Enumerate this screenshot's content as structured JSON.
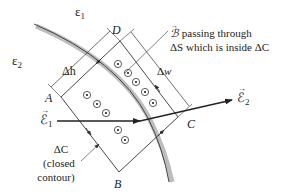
{
  "diagram": {
    "colors": {
      "line": "#333333",
      "boundary": "#b8b8b8",
      "boundary_edge": "#555555",
      "text": "#222222"
    },
    "regions": {
      "medium1_label": "ε",
      "medium1_sub": "1",
      "medium2_label": "ε",
      "medium2_sub": "2"
    },
    "corners": {
      "A": "A",
      "B": "B",
      "C": "C",
      "D": "D"
    },
    "dimensions": {
      "delta_h": "Δh",
      "delta_w_delta": "Δ",
      "delta_w_var": "w"
    },
    "fields": {
      "e1_symbol": "ℰ",
      "e1_sub": "1",
      "e2_symbol": "ℰ",
      "e2_sub": "2"
    },
    "annotations": {
      "b_symbol": "ℬ",
      "b_line1": " passing through",
      "b_line2": "ΔS which is inside ΔC",
      "contour_line1": "ΔC",
      "contour_line2": "(closed",
      "contour_line3": "contour)"
    },
    "flux_markers": {
      "symbol": "dot-in-circle",
      "count": 10,
      "meaning": "B field out of page"
    }
  }
}
